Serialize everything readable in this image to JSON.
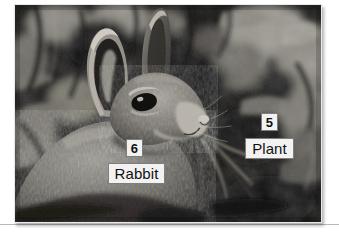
{
  "page": {
    "background_color": "#ffffff",
    "width": 339,
    "height": 247
  },
  "rule": {
    "name": "horizontal-divider",
    "color": "#b9b9b9"
  },
  "photo": {
    "alt": "Grayscale photograph of a cottontail rabbit in leafy undergrowth chewing on long plant stems",
    "frame_color": "#e9e9e9",
    "background_color": "#0d0d0d",
    "subject": "rabbit",
    "scene": "leaf litter and foliage"
  },
  "annotations": [
    {
      "id": "6",
      "number": "6",
      "label": "Rabbit",
      "number_box_name": "callout-number-6",
      "label_box_name": "callout-label-rabbit"
    },
    {
      "id": "5",
      "number": "5",
      "label": "Plant",
      "number_box_name": "callout-number-5",
      "label_box_name": "callout-label-plant"
    }
  ],
  "callout_style": {
    "fill": "#f2f2f2",
    "text": "#111111",
    "border": "#7d7d7d"
  }
}
